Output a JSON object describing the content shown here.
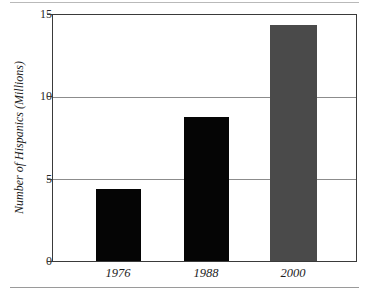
{
  "chart_data": {
    "type": "bar",
    "title": "",
    "xlabel": "",
    "ylabel": "Number of Hispanics (Millions)",
    "categories": [
      "1976",
      "1988",
      "2000"
    ],
    "values": [
      4.4,
      8.8,
      14.4
    ],
    "series": [
      {
        "name": "Number of Hispanics (Millions)",
        "values": [
          4.4,
          8.8,
          14.4
        ]
      }
    ],
    "bar_colors": [
      "#050505",
      "#050505",
      "#4a4a4a"
    ],
    "ylim": [
      0,
      15
    ],
    "yticks": [
      0,
      5,
      10,
      15
    ],
    "ytick_labels": [
      "0",
      "5",
      "10",
      "15"
    ],
    "grid": "horizontal",
    "gridline_values": [
      5,
      10
    ],
    "legend": "none"
  },
  "style": {
    "background": "#ffffff",
    "frame_color": "#3a3a3a",
    "gridline_color": "#8c8c8c",
    "rule_color": "#b9b9b9",
    "bar_black": "#050505",
    "bar_gray": "#4a4a4a",
    "text_color": "#1d1d1d"
  }
}
